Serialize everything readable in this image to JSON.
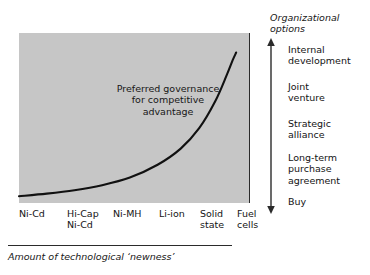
{
  "chart_data": {
    "type": "line",
    "title": "",
    "xlabel": "Amount of technological ‘newness’",
    "ylabel": "Organizational options",
    "grid": false,
    "legend": null,
    "categories": [
      "Ni-Cd",
      "Hi-Cap Ni-Cd",
      "Ni-MH",
      "Li-ion",
      "Solid state",
      "Fuel cells"
    ],
    "y_categories": [
      "Buy",
      "Long-term purchase agreement",
      "Strategic alliance",
      "Joint venture",
      "Internal development"
    ],
    "xlim": [
      0,
      1
    ],
    "ylim": [
      0,
      1
    ],
    "series": [
      {
        "name": "Preferred governance for competitive advantage",
        "x": [
          0.0,
          0.12,
          0.24,
          0.36,
          0.48,
          0.6,
          0.7,
          0.78,
          0.85,
          0.9,
          0.925,
          0.94
        ],
        "values": [
          0.04,
          0.055,
          0.075,
          0.105,
          0.15,
          0.225,
          0.32,
          0.44,
          0.6,
          0.755,
          0.84,
          0.885
        ]
      }
    ],
    "annotations": [
      {
        "text": "Preferred governance for competitive advantage",
        "x": 0.42,
        "y": 0.67
      }
    ]
  },
  "plot": {
    "annotation_lines": "Preferred\ngovernance for\ncompetitive\nadvantage"
  },
  "x_axis": {
    "title": "Amount of technological ‘newness’",
    "ticks": [
      {
        "label": "Ni-Cd",
        "left": 19
      },
      {
        "label": "Hi-Cap\nNi-Cd",
        "left": 67
      },
      {
        "label": "Ni-MH",
        "left": 113
      },
      {
        "label": "Li-ion",
        "left": 159
      },
      {
        "label": "Solid\nstate",
        "left": 200
      },
      {
        "label": "Fuel\ncells",
        "left": 237
      }
    ]
  },
  "y_axis": {
    "title": "Organizational\noptions",
    "options": [
      {
        "label": "Internal\ndevelopment",
        "top": 44
      },
      {
        "label": "Joint\nventure",
        "top": 81
      },
      {
        "label": "Strategic\nalliance",
        "top": 118
      },
      {
        "label": "Long-term\npurchase\nagreement",
        "top": 152
      },
      {
        "label": "Buy",
        "top": 196
      }
    ]
  },
  "colors": {
    "panel_fill": "#c6c6c6",
    "curve": "#111111",
    "axis": "#2b2b2b",
    "text": "#141414",
    "background": "#ffffff"
  }
}
